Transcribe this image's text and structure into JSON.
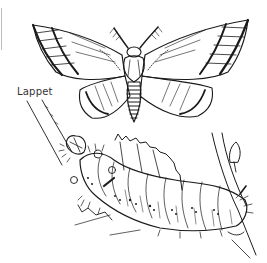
{
  "illustration": {
    "subject": "Lappet moth and caterpillar line drawing",
    "label": "Lappet",
    "colors": {
      "ink": "#1a1a1a",
      "paper": "#ffffff",
      "edge": "#bdbdbd"
    }
  }
}
